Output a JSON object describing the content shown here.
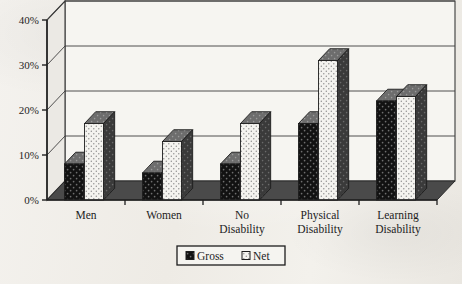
{
  "figure": {
    "kind": "scanned-bar-chart",
    "background_color": "#f1efea",
    "ink_color": "#1c1c1c"
  },
  "axis": {
    "y_ticks": [
      "0%",
      "10%",
      "20%",
      "30%",
      "40%"
    ]
  },
  "legend": {
    "items": [
      {
        "label": "Gross",
        "swatch": "dark-dotted-square",
        "color": "#111111"
      },
      {
        "label": "Net",
        "swatch": "light-dotted-square",
        "color": "#f3f2ee"
      }
    ]
  },
  "chart_data": {
    "type": "bar",
    "title": "",
    "xlabel": "",
    "ylabel": "",
    "ylim": [
      0,
      40
    ],
    "ytick_values": [
      0,
      10,
      20,
      30,
      40
    ],
    "ytick_labels": [
      "0%",
      "10%",
      "20%",
      "30%",
      "40%"
    ],
    "grid": true,
    "legend_position": "bottom-center",
    "style": "3d-column",
    "categories": [
      "Men",
      "Women",
      "No Disability",
      "Physical Disability",
      "Learning Disability"
    ],
    "category_lines": [
      [
        "Men"
      ],
      [
        "Women"
      ],
      [
        "No",
        "Disability"
      ],
      [
        "Physical",
        "Disability"
      ],
      [
        "Learning",
        "Disability"
      ]
    ],
    "series": [
      {
        "name": "Gross",
        "values": [
          8,
          6,
          8,
          17,
          22
        ]
      },
      {
        "name": "Net",
        "values": [
          17,
          13,
          17,
          31,
          23
        ]
      }
    ]
  }
}
